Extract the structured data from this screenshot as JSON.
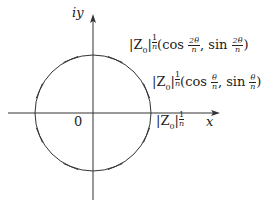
{
  "diagram": {
    "axes": {
      "x_label": "x",
      "y_label": "iy",
      "origin_label": "0"
    },
    "circle": {
      "center": [
        93,
        113
      ],
      "radius": 58,
      "tick_count": 8,
      "tick_angles_deg": [
        22.5,
        67.5,
        112.5,
        157.5,
        202.5,
        247.5,
        292.5,
        337.5
      ]
    },
    "labels": {
      "radius_label": {
        "base": "|Z",
        "sub": "0",
        "bar": "|",
        "exp_num": "1",
        "exp_den": "n"
      },
      "point1_label": {
        "base": "|Z",
        "sub": "0",
        "bar": "|",
        "exp_num": "1",
        "exp_den": "n",
        "func1": "(cos ",
        "angle_num": "θ",
        "angle_den": "n",
        "sep": ", sin ",
        "close": ")"
      },
      "point2_label": {
        "base": "|Z",
        "sub": "0",
        "bar": "|",
        "exp_num": "1",
        "exp_den": "n",
        "func1": "(cos ",
        "angle_num": "2θ",
        "angle_den": "n",
        "sep": ", sin ",
        "close": ")"
      }
    },
    "colors": {
      "stroke": "#333333",
      "background": "#ffffff"
    }
  }
}
